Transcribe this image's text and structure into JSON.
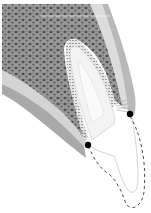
{
  "diagram": {
    "colors": {
      "background": "#ffffff",
      "bone_fill": "#8e8e8e",
      "bone_pore": "#5a5a5a",
      "cortical": "#bdbdbd",
      "gingiva": "#a8a8a8",
      "tooth_root": "#f2f2f2",
      "pdl_line": "#9a9a9a",
      "marker": "#000000",
      "dashed_outline": "#333333",
      "highlight_line": "#ffffff"
    },
    "markers": [
      {
        "name": "lingual-gingival-margin-point",
        "cx": 130,
        "cy": 114,
        "r": 3.2
      },
      {
        "name": "labial-gingival-margin-point",
        "cx": 88,
        "cy": 145,
        "r": 3.2
      }
    ]
  }
}
